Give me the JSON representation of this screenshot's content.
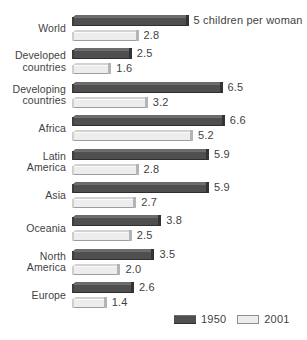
{
  "chart_data": {
    "type": "bar",
    "orientation": "horizontal",
    "title": "",
    "subtitle": "",
    "xlabel": "",
    "ylabel": "",
    "unit_note": "5 children per woman",
    "categories": [
      "World",
      "Developed\ncountries",
      "Developing\ncountries",
      "Africa",
      "Latin\nAmerica",
      "Asia",
      "Oceania",
      "North\nAmerica",
      "Europe"
    ],
    "series": [
      {
        "name": "1950",
        "color": "#4f4f4f",
        "values": [
          5.0,
          2.5,
          6.5,
          6.6,
          5.9,
          5.9,
          3.8,
          3.5,
          2.6
        ],
        "value_labels": [
          "5 children per woman",
          "2.5",
          "6.5",
          "6.6",
          "5.9",
          "5.9",
          "3.8",
          "3.5",
          "2.6"
        ]
      },
      {
        "name": "2001",
        "color": "#ededed",
        "values": [
          2.8,
          1.6,
          3.2,
          5.2,
          2.8,
          2.7,
          2.5,
          2.0,
          1.4
        ],
        "value_labels": [
          "2.8",
          "1.6",
          "3.2",
          "5.2",
          "2.8",
          "2.7",
          "2.5",
          "2.0",
          "1.4"
        ]
      }
    ],
    "xlim": [
      0,
      6.6
    ],
    "grid": false,
    "legend_position": "bottom-right"
  },
  "legend": {
    "items": [
      {
        "label": "1950",
        "swatch": "dark-swatch"
      },
      {
        "label": "2001",
        "swatch": "light-swatch"
      }
    ]
  }
}
